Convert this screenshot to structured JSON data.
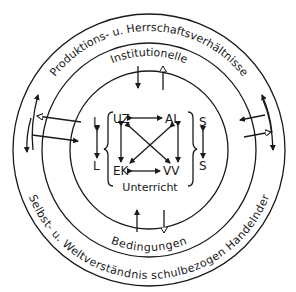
{
  "diagram": {
    "outer_ring_top": "Produktions- u. Herrschaftsverhältnisse",
    "outer_ring_bottom": "Selbst- u. Weltverständnis schulbezogen Handelnder",
    "middle_ring_top": "Institutionelle",
    "middle_ring_bottom": "Bedingungen",
    "core": {
      "title": "Unterricht",
      "top_left": "UZ",
      "top_right": "AL",
      "bottom_left": "EK",
      "bottom_right": "VV",
      "left_top": "L",
      "left_bottom": "L",
      "right_top": "S",
      "right_bottom": "S"
    }
  }
}
